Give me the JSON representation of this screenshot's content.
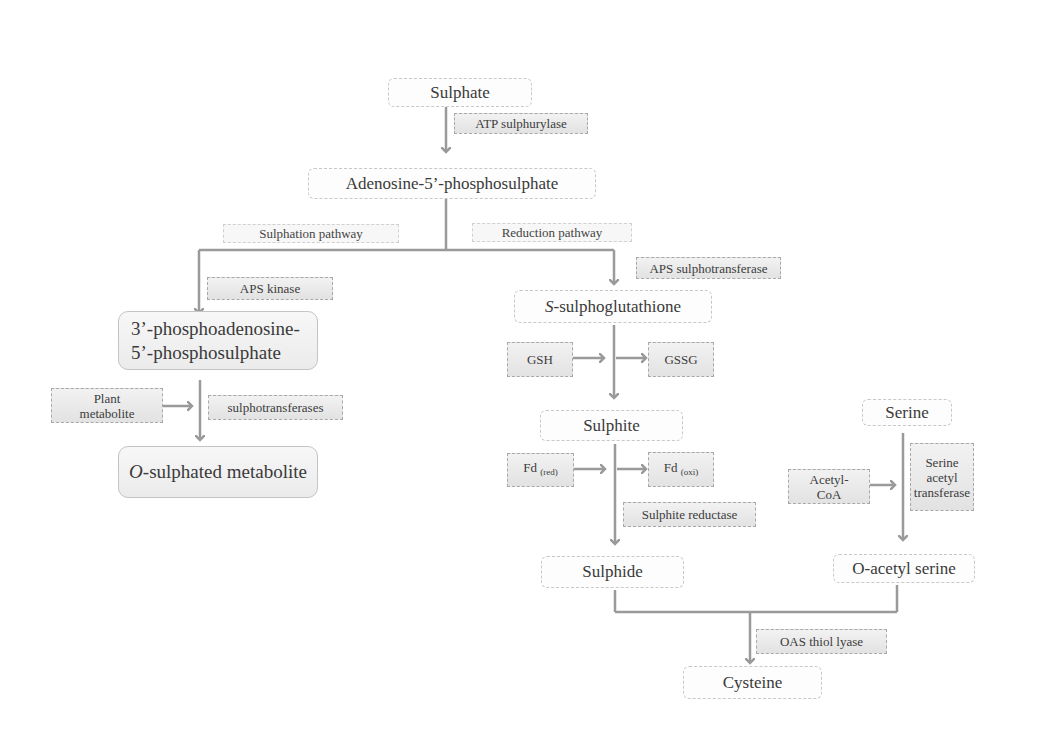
{
  "diagram": {
    "nodes": {
      "sulphate": "Sulphate",
      "aps": "Adenosine-5’-phosphosulphate",
      "paps_line1": "3’-phosphoadenosine-",
      "paps_line2": "5’-phosphosulphate",
      "o_sulphated_italic": "O",
      "o_sulphated_rest": "-sulphated metabolite",
      "s_sulpho_italic": "S",
      "s_sulpho_rest": "-sulphoglutathione",
      "sulphite": "Sulphite",
      "sulphide": "Sulphide",
      "serine": "Serine",
      "o_acetyl_serine": "O-acetyl serine",
      "cysteine": "Cysteine"
    },
    "enzymes": {
      "atp_sulphurylase": "ATP sulphurylase",
      "aps_kinase": "APS kinase",
      "sulphotransferases": "sulphotransferases",
      "aps_sulphotransferase": "APS sulphotransferase",
      "sulphite_reductase": "Sulphite reductase",
      "serine_acetyl_transferase_1": "Serine",
      "serine_acetyl_transferase_2": "acetyl",
      "serine_acetyl_transferase_3": "transferase",
      "oas_thiol_lyase": "OAS thiol lyase"
    },
    "cofactors": {
      "plant_metabolite_1": "Plant",
      "plant_metabolite_2": "metabolite",
      "gsh": "GSH",
      "gssg": "GSSG",
      "fd": "Fd",
      "fd_red_sub": "(red)",
      "fd_oxi_sub": "(oxi)",
      "acetyl_coa_1": "Acetyl-",
      "acetyl_coa_2": "CoA"
    },
    "pathway_labels": {
      "sulphation": "Sulphation pathway",
      "reduction": "Reduction pathway"
    },
    "colors": {
      "arrow": "#9a9a9a",
      "enzyme_fill": "#e6e6e6",
      "node_border": "#c8c8c8"
    }
  }
}
